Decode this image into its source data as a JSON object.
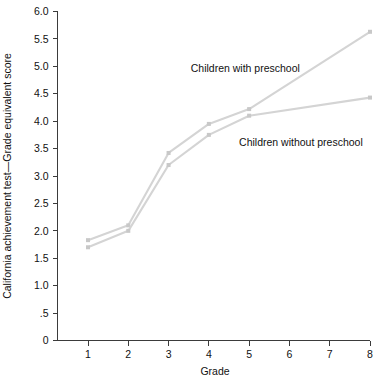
{
  "chart_data": {
    "type": "line",
    "title": "",
    "subtitle": "",
    "xlabel": "Grade",
    "ylabel": "California achievement test—Grade equivalent score",
    "x": [
      1,
      2,
      3,
      4,
      5,
      6,
      7,
      8
    ],
    "xlim": [
      0.55,
      8.0
    ],
    "ylim": [
      0,
      6.0
    ],
    "xticks": [
      1,
      2,
      3,
      4,
      5,
      6,
      7,
      8
    ],
    "xticklabels": [
      "1",
      "2",
      "3",
      "4",
      "5",
      "6",
      "7",
      "8"
    ],
    "yticks": [
      0,
      0.5,
      1.0,
      1.5,
      2.0,
      2.5,
      3.0,
      3.5,
      4.0,
      4.5,
      5.0,
      5.5,
      6.0
    ],
    "yticklabels": [
      "0",
      ".5",
      "1.0",
      "1.5",
      "2.0",
      "2.5",
      "3.0",
      "3.5",
      "4.0",
      "4.5",
      "5.0",
      "5.5",
      "6.0"
    ],
    "grid": false,
    "legend_position": "inline-annotations",
    "line_color": "#d4d4d4",
    "marker_color": "#c8c8c8",
    "axis_color": "#3b3b3b",
    "background_color": "#ffffff",
    "series": [
      {
        "name": "Children with preschool",
        "color": "#d4d4d4",
        "x": [
          1,
          2,
          3,
          4,
          5,
          8
        ],
        "values": [
          1.83,
          2.1,
          3.42,
          3.95,
          4.22,
          5.63
        ]
      },
      {
        "name": "Children without preschool",
        "color": "#d4d4d4",
        "x": [
          1,
          2,
          3,
          4,
          5,
          8
        ],
        "values": [
          1.7,
          2.0,
          3.2,
          3.75,
          4.1,
          4.43
        ]
      }
    ],
    "annotations": [
      {
        "text": "Children with preschool",
        "x": 3.55,
        "y": 4.9,
        "anchor": "start"
      },
      {
        "text": "Children without preschool",
        "x": 4.75,
        "y": 3.55,
        "anchor": "start"
      }
    ]
  }
}
